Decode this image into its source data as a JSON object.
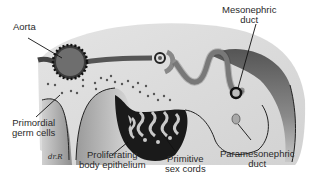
{
  "diagram": {
    "type": "anatomical illustration",
    "labels": {
      "aorta": "Aorta",
      "mesonephric_duct": [
        "Mesonephric",
        "duct"
      ],
      "primordial_germ_cells": [
        "Primordial",
        "germ cells"
      ],
      "proliferating_body_epithelium": [
        "Proliferating",
        "body epithelium"
      ],
      "primitive_sex_cords": [
        "Primitive",
        "sex cords"
      ],
      "paramesonephric_duct": [
        "Paramesonephric",
        "duct"
      ]
    },
    "signature": "dr.R",
    "colors": {
      "background_tissue": "#dcdcdc",
      "dark_gray": "#5a5a5a",
      "mid_gray": "#8c8c8c",
      "outline": "#1a1a1a",
      "aorta_fill": "#6e6e6e",
      "cords_dark": "#111111"
    }
  }
}
